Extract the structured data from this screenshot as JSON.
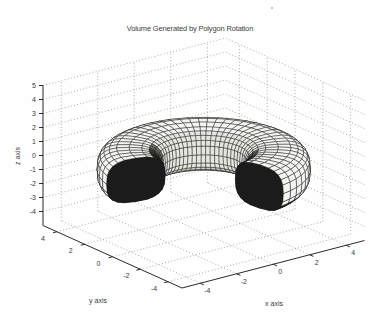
{
  "figure": {
    "background": "#fefefe"
  },
  "chart_data": {
    "type": "3d-surface-of-revolution",
    "title": "Volume Generated by Polygon Rotation",
    "xlabel": "x axis",
    "ylabel": "y axis",
    "zlabel": "z axis",
    "xlim": [
      -5,
      5
    ],
    "ylim": [
      -5,
      5
    ],
    "zlim": [
      -5,
      5
    ],
    "xticks": [
      -4,
      -2,
      0,
      2,
      4
    ],
    "yticks": [
      -4,
      -2,
      0,
      2,
      4
    ],
    "zticks": [
      -4,
      -3,
      -2,
      -1,
      0,
      1,
      2,
      3,
      4,
      5
    ],
    "grid": true,
    "grid_style": "dotted",
    "view": {
      "azimuth_deg": -37.5,
      "elevation_deg": 30
    },
    "surface": {
      "description": "polygon cross-section revolved partially about the z axis, gap facing viewer, cut ends capped dark",
      "sweep_start_deg": -79,
      "sweep_end_deg": 167,
      "segments_azimuth": 40,
      "profile_points": 24,
      "cross_section": {
        "shape": "superellipse",
        "r_center": 3.25,
        "z_center": -0.45,
        "r_half": 1.4,
        "z_half": 1.55,
        "exponent": 0.7
      },
      "face_color": "#f4f4f1",
      "inner_face_color": "#e6e6e1",
      "underside_color": "#cfcfca",
      "shadow_colors": [
        "#262623",
        "#3e3e3a",
        "#6e6e68"
      ],
      "edge_color": "#141414",
      "cap_color": "#1b1b1b"
    },
    "projection": {
      "origin": [
        203.75,
        163
      ],
      "x_axis_px": [
        18.25,
        -4.75
      ],
      "y_axis_px": [
        -13.9,
        -6.25
      ],
      "z_axis_px": [
        0,
        -14
      ]
    },
    "colors": {
      "axis_line": "#2a2a2a",
      "grid_dot": "#9a9a9a",
      "tick_text": "#3a3a3a"
    }
  },
  "scan_artifact": {
    "present": true
  }
}
